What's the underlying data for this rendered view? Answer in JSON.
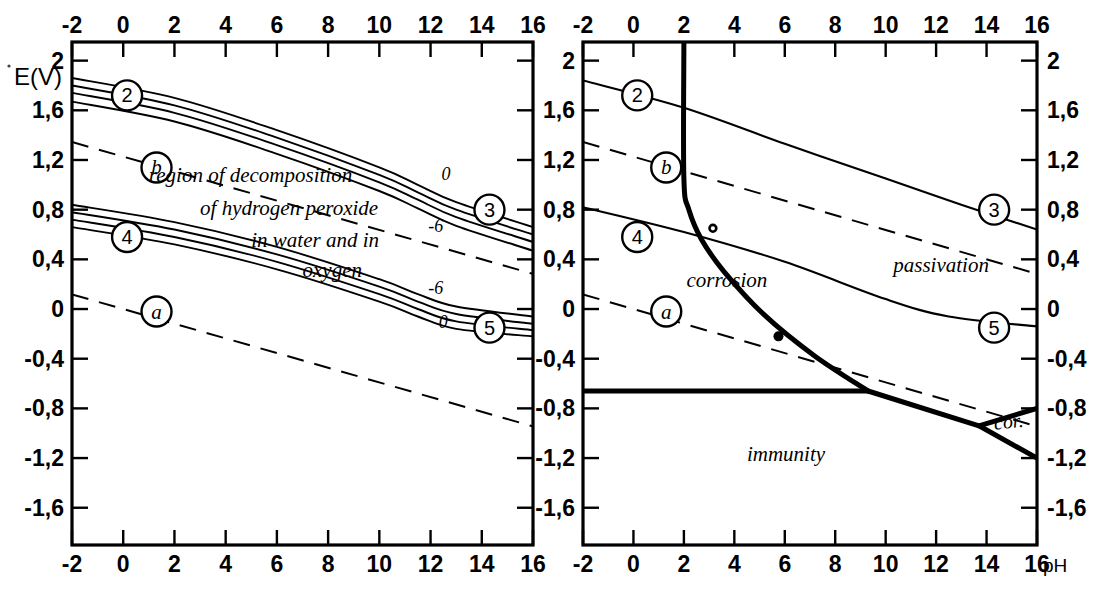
{
  "figure": {
    "kind": "pourbaix-diagram-pair",
    "y_axis_title": "E(V)",
    "x_axis_unit": "pH"
  },
  "axes": {
    "x_ticks": [
      "-2",
      "0",
      "2",
      "4",
      "6",
      "8",
      "10",
      "12",
      "14",
      "16"
    ],
    "x_values": [
      -2,
      0,
      2,
      4,
      6,
      8,
      10,
      12,
      14,
      16
    ],
    "y_ticks": [
      "2",
      "1,6",
      "1,2",
      "0,8",
      "0,4",
      "0",
      "-0,4",
      "-0,8",
      "-1,2",
      "-1,6"
    ],
    "y_values": [
      2,
      1.6,
      1.2,
      0.8,
      0.4,
      0,
      -0.4,
      -0.8,
      -1.2,
      -1.6
    ],
    "xlim": [
      -2,
      16
    ],
    "ylim": [
      -1.9,
      2.15
    ]
  },
  "left_panel": {
    "name": "hydrogen-peroxide-decomposition",
    "region_text_lines": [
      "region of decomposition",
      "of hydrogen peroxide",
      "in water and in",
      "oxygen"
    ],
    "badges": [
      {
        "label": "2",
        "x": 0.15,
        "y": 1.72
      },
      {
        "label": "b",
        "x": 1.3,
        "y": 1.14
      },
      {
        "label": "3",
        "x": 14.3,
        "y": 0.8
      },
      {
        "label": "4",
        "x": 0.15,
        "y": 0.58
      },
      {
        "label": "5",
        "x": 14.3,
        "y": -0.15
      },
      {
        "label": "a",
        "x": 1.3,
        "y": -0.02
      }
    ],
    "curve_labels": [
      {
        "text": "0",
        "x": 12.6,
        "y": 1.04
      },
      {
        "text": "-6",
        "x": 12.2,
        "y": 0.62
      },
      {
        "text": "-6",
        "x": 12.2,
        "y": 0.12
      },
      {
        "text": "0",
        "x": 12.5,
        "y": -0.15
      }
    ]
  },
  "right_panel": {
    "name": "corrosion-passivation-immunity",
    "regions": [
      {
        "label": "corrosion",
        "x": 2.1,
        "y": 0.18
      },
      {
        "label": "passivation",
        "x": 10.3,
        "y": 0.3
      },
      {
        "label": "immunity",
        "x": 4.5,
        "y": -1.22
      },
      {
        "label": "cor.",
        "x": 14.9,
        "y": -0.96
      }
    ],
    "badges": [
      {
        "label": "2",
        "x": 0.15,
        "y": 1.72
      },
      {
        "label": "b",
        "x": 1.3,
        "y": 1.14
      },
      {
        "label": "3",
        "x": 14.3,
        "y": 0.8
      },
      {
        "label": "4",
        "x": 0.15,
        "y": 0.58
      },
      {
        "label": "5",
        "x": 14.3,
        "y": -0.15
      },
      {
        "label": "a",
        "x": 1.3,
        "y": -0.02
      }
    ],
    "markers": [
      {
        "style": "open",
        "x": 3.15,
        "y": 0.65
      },
      {
        "style": "filled",
        "x": 5.75,
        "y": -0.22
      }
    ]
  },
  "chart_data": {
    "type": "line",
    "title": "",
    "xlabel": "pH",
    "ylabel": "E(V)",
    "xlim": [
      -2,
      16
    ],
    "ylim": [
      -1.9,
      2.15
    ],
    "grid": false,
    "legend": "none",
    "series": [
      {
        "name": "line-a (H2/H2O equilibrium)",
        "panel": "both",
        "style": "dashed",
        "points": [
          [
            -2,
            0.118
          ],
          [
            16,
            -0.945
          ]
        ]
      },
      {
        "name": "line-b (O2/H2O equilibrium)",
        "panel": "both",
        "style": "dashed",
        "points": [
          [
            -2,
            1.345
          ],
          [
            16,
            0.283
          ]
        ]
      },
      {
        "name": "curve-2 upper band 0",
        "panel": "left",
        "style": "solid",
        "points": [
          [
            -2,
            1.86
          ],
          [
            2,
            1.7
          ],
          [
            6,
            1.44
          ],
          [
            10,
            1.14
          ],
          [
            11.5,
            1.0
          ],
          [
            13,
            0.86
          ],
          [
            16,
            0.66
          ]
        ]
      },
      {
        "name": "curve-2 upper band -2",
        "panel": "left",
        "style": "solid",
        "points": [
          [
            -2,
            1.8
          ],
          [
            2,
            1.64
          ],
          [
            6,
            1.38
          ],
          [
            10,
            1.08
          ],
          [
            11.5,
            0.94
          ],
          [
            13,
            0.8
          ],
          [
            16,
            0.6
          ]
        ]
      },
      {
        "name": "curve-2 upper band -4",
        "panel": "left",
        "style": "solid",
        "points": [
          [
            -2,
            1.74
          ],
          [
            2,
            1.58
          ],
          [
            6,
            1.32
          ],
          [
            10,
            1.02
          ],
          [
            11.5,
            0.88
          ],
          [
            13,
            0.74
          ],
          [
            16,
            0.54
          ]
        ]
      },
      {
        "name": "curve-3 upper band -6",
        "panel": "left",
        "style": "solid",
        "points": [
          [
            -2,
            1.67
          ],
          [
            2,
            1.51
          ],
          [
            6,
            1.25
          ],
          [
            10,
            0.95
          ],
          [
            11.5,
            0.81
          ],
          [
            13,
            0.67
          ],
          [
            16,
            0.47
          ]
        ]
      },
      {
        "name": "curve-4 lower band 0",
        "panel": "left",
        "style": "solid",
        "points": [
          [
            -2,
            0.84
          ],
          [
            2,
            0.7
          ],
          [
            6,
            0.5
          ],
          [
            10,
            0.24
          ],
          [
            11.5,
            0.12
          ],
          [
            13,
            0.02
          ],
          [
            16,
            -0.06
          ]
        ]
      },
      {
        "name": "curve-4 lower band -2",
        "panel": "left",
        "style": "solid",
        "points": [
          [
            -2,
            0.78
          ],
          [
            2,
            0.64
          ],
          [
            6,
            0.44
          ],
          [
            10,
            0.18
          ],
          [
            11.5,
            0.06
          ],
          [
            13,
            -0.04
          ],
          [
            16,
            -0.12
          ]
        ]
      },
      {
        "name": "curve-4 lower band -4",
        "panel": "left",
        "style": "solid",
        "points": [
          [
            -2,
            0.72
          ],
          [
            2,
            0.58
          ],
          [
            6,
            0.38
          ],
          [
            10,
            0.12
          ],
          [
            11.5,
            0.0
          ],
          [
            13,
            -0.1
          ],
          [
            16,
            -0.17
          ]
        ]
      },
      {
        "name": "curve-5 lower band -6",
        "panel": "left",
        "style": "solid",
        "points": [
          [
            -2,
            0.66
          ],
          [
            2,
            0.52
          ],
          [
            6,
            0.32
          ],
          [
            10,
            0.06
          ],
          [
            11.5,
            -0.06
          ],
          [
            13,
            -0.16
          ],
          [
            16,
            -0.22
          ]
        ]
      },
      {
        "name": "curve-2-3 (right)",
        "panel": "right",
        "style": "solid",
        "points": [
          [
            -2,
            1.84
          ],
          [
            2,
            1.62
          ],
          [
            6,
            1.33
          ],
          [
            10,
            1.05
          ],
          [
            13,
            0.84
          ],
          [
            16,
            0.64
          ]
        ]
      },
      {
        "name": "curve-4-5 (right)",
        "panel": "right",
        "style": "solid",
        "points": [
          [
            -2,
            0.82
          ],
          [
            2,
            0.62
          ],
          [
            6,
            0.38
          ],
          [
            10,
            0.08
          ],
          [
            12.5,
            -0.06
          ],
          [
            16,
            -0.14
          ]
        ]
      },
      {
        "name": "corrosion-passivation-boundary",
        "panel": "right",
        "style": "thick",
        "points": [
          [
            2.0,
            2.15
          ],
          [
            2.0,
            1.05
          ],
          [
            2.2,
            0.8
          ],
          [
            2.7,
            0.56
          ],
          [
            3.6,
            0.3
          ],
          [
            5.2,
            -0.05
          ],
          [
            7.2,
            -0.38
          ],
          [
            9.3,
            -0.66
          ]
        ]
      },
      {
        "name": "immunity-boundary-horizontal",
        "panel": "right",
        "style": "thick",
        "points": [
          [
            -2,
            -0.66
          ],
          [
            9.3,
            -0.66
          ]
        ]
      },
      {
        "name": "immunity-boundary-slope",
        "panel": "right",
        "style": "thick",
        "points": [
          [
            9.3,
            -0.66
          ],
          [
            13.7,
            -0.94
          ],
          [
            16,
            -1.2
          ]
        ]
      },
      {
        "name": "corrosion-wedge-upper",
        "panel": "right",
        "style": "thick",
        "points": [
          [
            13.7,
            -0.94
          ],
          [
            16,
            -0.8
          ]
        ]
      }
    ]
  }
}
